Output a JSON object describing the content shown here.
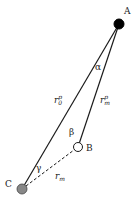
{
  "diagram": {
    "points": {
      "A": {
        "label": "A",
        "x": 119,
        "y": 24,
        "r": 5,
        "fill": "#000000"
      },
      "B": {
        "label": "B",
        "x": 78,
        "y": 147,
        "r": 4.5,
        "fill": "#ffffff"
      },
      "C": {
        "label": "C",
        "x": 22,
        "y": 189,
        "r": 5,
        "fill": "#888888"
      }
    },
    "edges": [
      {
        "from": "A",
        "to": "C",
        "style": "solid",
        "label": "r0p"
      },
      {
        "from": "A",
        "to": "B",
        "style": "solid",
        "label": "rmp"
      },
      {
        "from": "C",
        "to": "B",
        "style": "dashed",
        "label": "rm"
      }
    ],
    "labels": {
      "A": "A",
      "B": "B",
      "C": "C",
      "alpha": "α",
      "beta": "β",
      "gamma": "γ",
      "r0p_base": "r",
      "r0p_sup": "p",
      "r0p_sub": "0",
      "rmp_base": "r",
      "rmp_sup": "p",
      "rmp_sub": "m",
      "rm_base": "r",
      "rm_sub": "m"
    },
    "colors": {
      "line": "#1a1a1a",
      "A_fill": "#000000",
      "B_fill": "#ffffff",
      "C_fill": "#888888"
    }
  }
}
